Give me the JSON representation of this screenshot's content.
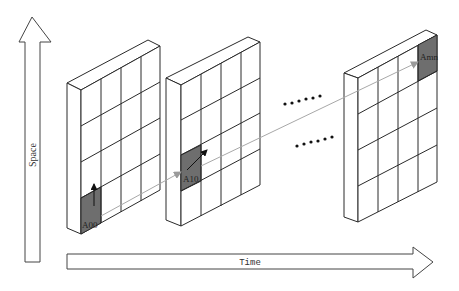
{
  "axes": {
    "space_label": "Space",
    "time_label": "Time"
  },
  "matrices": [
    {
      "name": "first",
      "highlight_label": "A00",
      "highlight_cell": {
        "row": 3,
        "col": 0
      }
    },
    {
      "name": "second",
      "highlight_label": "A10",
      "highlight_cell": {
        "row": 2,
        "col": 0
      }
    },
    {
      "name": "last",
      "highlight_label": "Amn",
      "highlight_cell": {
        "row": 0,
        "col": 3
      }
    }
  ],
  "grid": {
    "rows": 4,
    "cols": 4
  },
  "ellipsis": {
    "top": "......",
    "bottom": "......"
  },
  "colors": {
    "highlight": "#6e6e6e",
    "link": "#a8a8a8",
    "stroke": "#2a2a2a"
  }
}
